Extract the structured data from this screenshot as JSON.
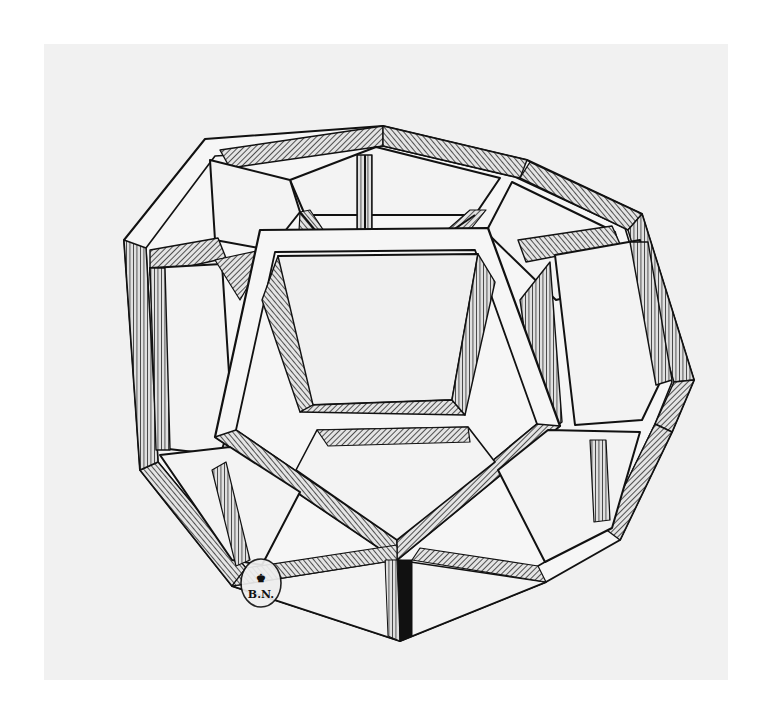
{
  "figure": {
    "background_color": "#ffffff",
    "paper_color": "#f1f1f1",
    "ink_color": "#111111",
    "hatch_color": "#3a3a3a"
  },
  "stamp": {
    "emblem": "♚",
    "text": "B.N."
  }
}
